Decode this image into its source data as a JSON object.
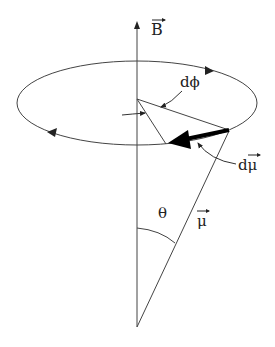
{
  "diagram": {
    "type": "precession of magnetic moment",
    "labels": {
      "field": "B",
      "dphi": "dϕ",
      "dmu": "dμ",
      "theta": "θ",
      "mu": "μ"
    },
    "colors": {
      "stroke": "#333333",
      "heavy_arrow": "#000000",
      "background": "#ffffff"
    }
  }
}
